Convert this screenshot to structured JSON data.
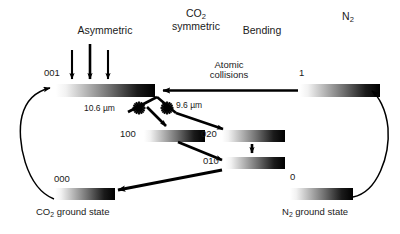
{
  "figure": {
    "background_color": "#ffffff",
    "ink_color": "#000000"
  },
  "column_headers": [
    {
      "id": "asymmetric",
      "label": "Asymmetric",
      "x": 105,
      "y": 25
    },
    {
      "id": "co2-symmetric",
      "label_line1": "CO",
      "label_sub1": "2",
      "label_line2": "symmetric",
      "x": 196,
      "y": 8
    },
    {
      "id": "bending",
      "label": "Bending",
      "x": 262,
      "y": 25
    },
    {
      "id": "nitrogen",
      "label": "N",
      "label_sub": "2",
      "x": 348,
      "y": 11
    }
  ],
  "pump_arrows": {
    "name": "pump-excitation-arrows",
    "count": 3,
    "x_positions": [
      72,
      90,
      108
    ],
    "y_top": 50,
    "y_bottom": 84
  },
  "levels": [
    {
      "id": "co2-001",
      "label": "001",
      "label_x": 48,
      "label_y": 72,
      "bar": {
        "x": 56,
        "y": 84,
        "w": 99,
        "h": 13
      }
    },
    {
      "id": "n2-excited",
      "label": "1",
      "label_x": 300,
      "label_y": 72,
      "bar": {
        "x": 300,
        "y": 84,
        "w": 80,
        "h": 13
      }
    },
    {
      "id": "co2-100",
      "label": "100",
      "label_x": 122,
      "label_y": 129,
      "bar": {
        "x": 144,
        "y": 130,
        "w": 61,
        "h": 12
      }
    },
    {
      "id": "co2-020",
      "label": "020",
      "label_x": 205,
      "label_y": 129,
      "bar": {
        "x": 222,
        "y": 130,
        "w": 63,
        "h": 12
      }
    },
    {
      "id": "co2-010",
      "label": "010",
      "label_x": 205,
      "label_y": 156,
      "bar": {
        "x": 225,
        "y": 157,
        "w": 60,
        "h": 12
      }
    },
    {
      "id": "co2-000",
      "label": "000",
      "label_x": 56,
      "label_y": 178,
      "bar": {
        "x": 55,
        "y": 188,
        "w": 60,
        "h": 12
      }
    },
    {
      "id": "n2-ground",
      "label": "0",
      "label_x": 291,
      "label_y": 176,
      "bar": {
        "x": 290,
        "y": 188,
        "w": 63,
        "h": 12
      }
    }
  ],
  "annotations": {
    "atomic_collisions": {
      "line1": "Atomic",
      "line2": "collisions",
      "x": 228,
      "y": 62
    },
    "laser_lines": [
      {
        "id": "laser-10-6",
        "label": "10.6 µm",
        "x": 86,
        "y": 105,
        "burst_cx": 139,
        "burst_cy": 108
      },
      {
        "id": "laser-9-6",
        "label": "9.6 µm",
        "x": 178,
        "y": 103,
        "burst_cx": 167,
        "burst_cy": 108
      }
    ]
  },
  "captions": [
    {
      "id": "co2-ground-caption",
      "text_pre": "CO",
      "sub": "2",
      "text_post": " ground state",
      "x": 38,
      "y": 209
    },
    {
      "id": "n2-ground-caption",
      "text_pre": "N",
      "sub": "2",
      "text_post": " ground state",
      "x": 283,
      "y": 209
    }
  ],
  "flow_arrows": [
    {
      "id": "n2-to-co2-transfer",
      "from": "n2-excited",
      "to": "co2-001",
      "style": "straight-horizontal"
    },
    {
      "id": "co2-001-to-100",
      "from": "co2-001",
      "to": "co2-100",
      "style": "straight"
    },
    {
      "id": "co2-001-to-020",
      "from": "co2-001",
      "to": "co2-020",
      "style": "straight"
    },
    {
      "id": "co2-100-to-010",
      "from": "co2-100",
      "to": "co2-010",
      "style": "straight"
    },
    {
      "id": "co2-020-to-010",
      "from": "co2-020",
      "to": "co2-010",
      "style": "vertical"
    },
    {
      "id": "co2-010-to-000",
      "from": "co2-010",
      "to": "co2-000",
      "style": "straight"
    },
    {
      "id": "co2-000-to-001-recycle",
      "from": "co2-000",
      "to": "co2-001",
      "style": "curved-left"
    },
    {
      "id": "n2-ground-to-excited-recycle",
      "from": "n2-ground",
      "to": "n2-excited",
      "style": "curved-right"
    }
  ]
}
